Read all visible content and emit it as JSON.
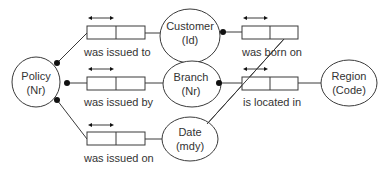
{
  "diagram": {
    "type": "ORM fact-type diagram",
    "entities": [
      {
        "id": "policy",
        "name": "Policy",
        "ref": "(Nr)"
      },
      {
        "id": "customer",
        "name": "Customer",
        "ref": "(Id)"
      },
      {
        "id": "branch",
        "name": "Branch",
        "ref": "(Nr)"
      },
      {
        "id": "date",
        "name": "Date",
        "ref": "(mdy)"
      },
      {
        "id": "region",
        "name": "Region",
        "ref": "(Code)"
      }
    ],
    "fact_types": [
      {
        "id": "issued-to",
        "label": "was issued to",
        "from": "policy",
        "to": "customer",
        "uniqueness": "first-role",
        "mandatory": "policy"
      },
      {
        "id": "issued-by",
        "label": "was issued by",
        "from": "policy",
        "to": "branch",
        "uniqueness": "first-role",
        "mandatory": "policy"
      },
      {
        "id": "issued-on",
        "label": "was issued on",
        "from": "policy",
        "to": "date",
        "uniqueness": "first-role",
        "mandatory": "policy"
      },
      {
        "id": "born-on",
        "label": "was born on",
        "from": "customer",
        "to": "date",
        "uniqueness": "first-role",
        "mandatory": "customer"
      },
      {
        "id": "located-in",
        "label": "is located in",
        "from": "branch",
        "to": "region",
        "uniqueness": "first-role",
        "mandatory": "branch"
      }
    ],
    "colors": {
      "stroke": "#3a3a3a",
      "dot": "#111111",
      "text": "#333333",
      "background": "#ffffff"
    }
  }
}
